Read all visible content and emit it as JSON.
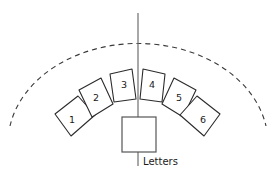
{
  "diagram": {
    "title": "",
    "caption": {
      "text": "Letters",
      "x": 143,
      "y": 162
    },
    "colors": {
      "background": "#ffffff",
      "panel_stroke": "#2b2b2b",
      "panel_fill": "#ffffff",
      "axis_stroke": "#6e6e6e",
      "arc_stroke": "#3a3a3a",
      "center_box_stroke": "#555555",
      "label_text": "#1a1a1a"
    },
    "center_box": {
      "name": "letters-box",
      "x": 122,
      "y": 117,
      "width": 34,
      "height": 35
    },
    "axis": {
      "name": "center-axis",
      "x": 138,
      "y_top": 13,
      "y_bottom": 166
    },
    "arc": {
      "name": "boundary-arc",
      "path": "M 10,126 A 130 100 0 0 1 266,126",
      "dash": "5 4"
    },
    "panels": [
      {
        "label": "1",
        "name": "panel-1",
        "points": "55,114 78,96 95,115 71,136",
        "label_x": 72,
        "label_y": 120
      },
      {
        "label": "2",
        "name": "panel-2",
        "points": "79,90 101,78 113,104 92,117",
        "label_x": 96,
        "label_y": 98
      },
      {
        "label": "3",
        "name": "panel-3",
        "points": "110,74 132,69 136,99 114,102",
        "label_x": 124,
        "label_y": 85
      },
      {
        "label": "4",
        "name": "panel-4",
        "points": "143,69 165,74 162,102 140,99",
        "label_x": 152,
        "label_y": 85
      },
      {
        "label": "5",
        "name": "panel-5",
        "points": "174,78 196,90 183,117 162,104",
        "label_x": 179,
        "label_y": 98
      },
      {
        "label": "6",
        "name": "panel-6",
        "points": "197,96 220,114 204,136 180,115",
        "label_x": 203,
        "label_y": 120
      }
    ]
  }
}
